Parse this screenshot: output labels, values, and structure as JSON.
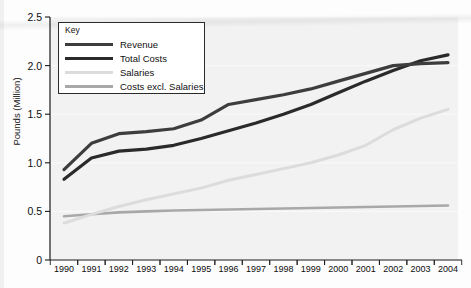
{
  "chart_data": {
    "type": "line",
    "title": "",
    "xlabel": "",
    "ylabel": "Pounds (Million)",
    "xlim": [
      1990,
      2004
    ],
    "ylim": [
      0,
      2.5
    ],
    "yticks": [
      "0",
      "0.5",
      "1.0",
      "1.5",
      "2.0",
      "2.5"
    ],
    "ytick_values": [
      0,
      0.5,
      1.0,
      1.5,
      2.0,
      2.5
    ],
    "grid": true,
    "legend_position": "top-left",
    "legend_title": "Key",
    "categories": [
      1990,
      1991,
      1992,
      1993,
      1994,
      1995,
      1996,
      1997,
      1998,
      1999,
      2000,
      2001,
      2002,
      2003,
      2004
    ],
    "xtick_labels": [
      "1990",
      "1991",
      "1992",
      "1993",
      "1994",
      "1995",
      "1996",
      "1997",
      "1998",
      "1999",
      "2000",
      "2001",
      "2002",
      "2003",
      "2004"
    ],
    "series": [
      {
        "name": "Revenue",
        "color": "#3d3d3d",
        "width": 3.2,
        "values": [
          0.93,
          1.2,
          1.3,
          1.32,
          1.35,
          1.44,
          1.6,
          1.65,
          1.7,
          1.76,
          1.84,
          1.92,
          2.0,
          2.02,
          2.03
        ]
      },
      {
        "name": "Total Costs",
        "color": "#2a2a2a",
        "width": 3.2,
        "values": [
          0.83,
          1.05,
          1.12,
          1.14,
          1.18,
          1.25,
          1.33,
          1.41,
          1.5,
          1.6,
          1.72,
          1.84,
          1.95,
          2.05,
          2.11
        ]
      },
      {
        "name": "Salaries",
        "color": "#dcdcdc",
        "width": 3.0,
        "values": [
          0.38,
          0.47,
          0.55,
          0.62,
          0.68,
          0.74,
          0.82,
          0.88,
          0.94,
          1.0,
          1.08,
          1.18,
          1.34,
          1.46,
          1.55
        ]
      },
      {
        "name": "Costs excl. Salaries",
        "color": "#a8a8a8",
        "width": 2.6,
        "values": [
          0.45,
          0.47,
          0.49,
          0.5,
          0.51,
          0.515,
          0.52,
          0.525,
          0.53,
          0.535,
          0.54,
          0.545,
          0.55,
          0.555,
          0.56
        ]
      }
    ]
  },
  "axis": {
    "y_axis_title": "Pounds (Million)"
  },
  "legend": {
    "title": "Key",
    "entries": [
      {
        "label": "Revenue",
        "color": "#3d3d3d"
      },
      {
        "label": "Total Costs",
        "color": "#2a2a2a"
      },
      {
        "label": "Salaries",
        "color": "#dcdcdc"
      },
      {
        "label": "Costs excl. Salaries",
        "color": "#a8a8a8"
      }
    ]
  },
  "colors": {
    "panel_background": "#f2f2f2",
    "page_background": "#fdfdfd",
    "axis": "#1a1a1a",
    "gridline": "#fafafa"
  }
}
